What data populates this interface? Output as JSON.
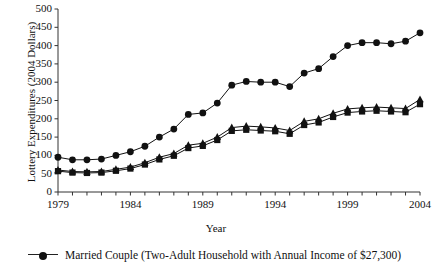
{
  "chart_data": {
    "type": "line",
    "title": "",
    "xlabel": "Year",
    "ylabel": "Lottery Expenditures (2004 Dollars)",
    "xlim": [
      1979,
      2004
    ],
    "ylim": [
      0,
      500
    ],
    "ytick_labels": [
      "0",
      "50",
      "100",
      "150",
      "200",
      "250",
      "300",
      "350",
      "400",
      "450",
      "500"
    ],
    "ytick_values": [
      0,
      50,
      100,
      150,
      200,
      250,
      300,
      350,
      400,
      450,
      500
    ],
    "xtick_labels": [
      "1979",
      "1984",
      "1989",
      "1994",
      "1999",
      "2004"
    ],
    "xtick_values": [
      1979,
      1984,
      1989,
      1994,
      1999,
      2004
    ],
    "grid": false,
    "x": [
      1979,
      1980,
      1981,
      1982,
      1983,
      1984,
      1985,
      1986,
      1987,
      1988,
      1989,
      1990,
      1991,
      1992,
      1993,
      1994,
      1995,
      1996,
      1997,
      1998,
      1999,
      2000,
      2001,
      2002,
      2003,
      2004
    ],
    "series": [
      {
        "name": "Married Couple (Two-Adult Household with Annual Income of $27,300)",
        "marker": "circle",
        "color": "#111111",
        "values": [
          95,
          88,
          88,
          90,
          100,
          110,
          125,
          150,
          172,
          212,
          216,
          243,
          292,
          302,
          300,
          300,
          288,
          325,
          337,
          370,
          400,
          408,
          408,
          405,
          400,
          398
        ]
      },
      {
        "name": "series-triangle",
        "marker": "triangle",
        "color": "#111111",
        "values": [
          60,
          56,
          55,
          56,
          62,
          68,
          80,
          95,
          105,
          128,
          133,
          150,
          176,
          180,
          178,
          175,
          168,
          193,
          200,
          215,
          227,
          230,
          232,
          230,
          228,
          228
        ]
      },
      {
        "name": "series-square",
        "marker": "square",
        "color": "#111111",
        "values": [
          57,
          53,
          52,
          53,
          58,
          64,
          75,
          89,
          99,
          120,
          126,
          142,
          167,
          170,
          168,
          166,
          159,
          183,
          190,
          205,
          217,
          220,
          222,
          220,
          218,
          218
        ]
      }
    ],
    "series_tail": {
      "note": "last segment rises",
      "circle_2003": 412,
      "circle_2004": 435,
      "triangle_2004": 253,
      "square_2004": 240
    }
  },
  "legend": {
    "entries": [
      {
        "label": "Married Couple (Two-Adult Household with Annual Income of $27,300)",
        "marker": "circle"
      }
    ]
  },
  "axes": {
    "x_title": "Year",
    "y_title": "Lottery Expenditures (2004 Dollars)"
  },
  "colors": {
    "ink": "#111111",
    "axis": "#333333",
    "background": "#ffffff"
  }
}
